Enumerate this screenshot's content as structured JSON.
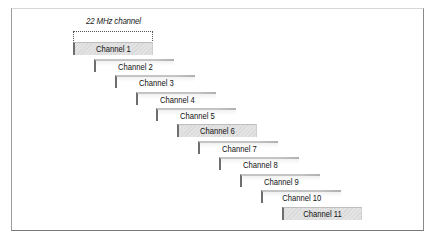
{
  "diagram": {
    "bracket_label": "22 MHz channel",
    "highlight_color": "#dcdcdc",
    "channels": [
      {
        "label": "Channel 1",
        "highlighted": true
      },
      {
        "label": "Channel 2",
        "highlighted": false
      },
      {
        "label": "Channel 3",
        "highlighted": false
      },
      {
        "label": "Channel 4",
        "highlighted": false
      },
      {
        "label": "Channel 5",
        "highlighted": false
      },
      {
        "label": "Channel 6",
        "highlighted": true
      },
      {
        "label": "Channel 7",
        "highlighted": false
      },
      {
        "label": "Channel 8",
        "highlighted": false
      },
      {
        "label": "Channel 9",
        "highlighted": false
      },
      {
        "label": "Channel 10",
        "highlighted": false
      },
      {
        "label": "Channel 11",
        "highlighted": true
      }
    ]
  }
}
